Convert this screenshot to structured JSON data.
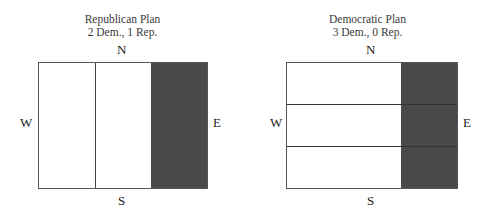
{
  "panels": [
    {
      "title": "Republican Plan",
      "subtitle": "2 Dem., 1 Rep.",
      "compass": {
        "north": "N",
        "south": "S",
        "west": "W",
        "east": "E"
      },
      "layout": "vertical-strips",
      "districts": [
        {
          "id": 1,
          "party": "Dem.",
          "shaded": false
        },
        {
          "id": 2,
          "party": "Dem.",
          "shaded": false
        },
        {
          "id": 3,
          "party": "Rep.",
          "shaded": true
        }
      ]
    },
    {
      "title": "Democratic Plan",
      "subtitle": "3 Dem., 0 Rep.",
      "compass": {
        "north": "N",
        "south": "S",
        "west": "W",
        "east": "E"
      },
      "layout": "horizontal-strips",
      "districts": [
        {
          "id": 1,
          "party": "Dem.",
          "shaded": false
        },
        {
          "id": 2,
          "party": "Dem.",
          "shaded": false
        },
        {
          "id": 3,
          "party": "Dem.",
          "shaded": false
        }
      ],
      "shaded_region": "east column"
    }
  ],
  "colors": {
    "shaded": "#4a4a4a",
    "unshaded": "#ffffff",
    "border": "#555555"
  }
}
